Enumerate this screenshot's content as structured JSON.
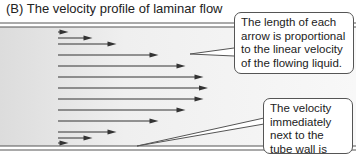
{
  "title": "(B)  The velocity profile of laminar flow",
  "callouts": {
    "arrow_length": "The length of each arrow is proportional to the linear velocity of the flowing liquid.",
    "wall_velocity": "The velocity immediately next to the tube wall is zero."
  },
  "profile": {
    "relative_velocities": [
      0.07,
      0.23,
      0.39,
      0.67,
      0.85,
      0.97,
      1.0,
      0.97,
      0.85,
      0.67,
      0.39,
      0.23,
      0.07
    ],
    "wall_velocity": 0
  },
  "colors": {
    "arrow": "#333333",
    "tube_wall": "#444444",
    "tube_fill_left": "#e6e6e6",
    "tube_fill_right": "#f7f7f7"
  }
}
